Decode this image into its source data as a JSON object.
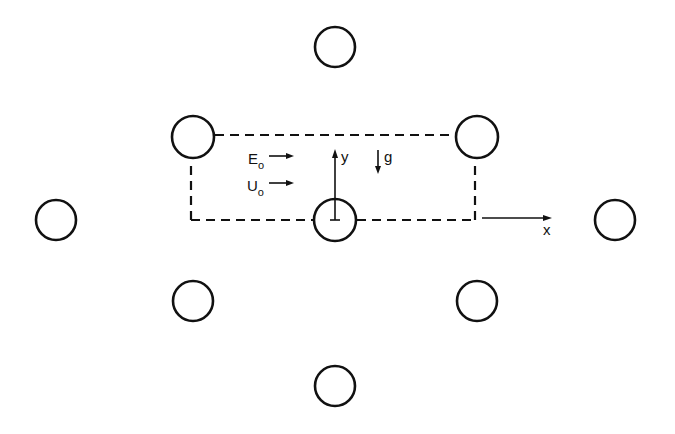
{
  "diagram": {
    "stroke_color": "#111111",
    "background": "#ffffff",
    "circles": [
      {
        "id": "top",
        "cx": 335,
        "cy": 47,
        "r": 20
      },
      {
        "id": "upper-left",
        "cx": 193,
        "cy": 137,
        "r": 21
      },
      {
        "id": "upper-right",
        "cx": 477,
        "cy": 137,
        "r": 21
      },
      {
        "id": "left",
        "cx": 56,
        "cy": 220,
        "r": 20
      },
      {
        "id": "center",
        "cx": 335,
        "cy": 220,
        "r": 21
      },
      {
        "id": "right",
        "cx": 615,
        "cy": 220,
        "r": 20
      },
      {
        "id": "lower-left",
        "cx": 193,
        "cy": 301,
        "r": 20
      },
      {
        "id": "lower-right",
        "cx": 477,
        "cy": 301,
        "r": 20
      },
      {
        "id": "bottom",
        "cx": 335,
        "cy": 386,
        "r": 20
      }
    ],
    "labels": {
      "E_main": "E",
      "E_sub": "o",
      "U_main": "U",
      "U_sub": "o",
      "y_axis": "y",
      "x_axis": "x",
      "gravity": "g"
    }
  }
}
